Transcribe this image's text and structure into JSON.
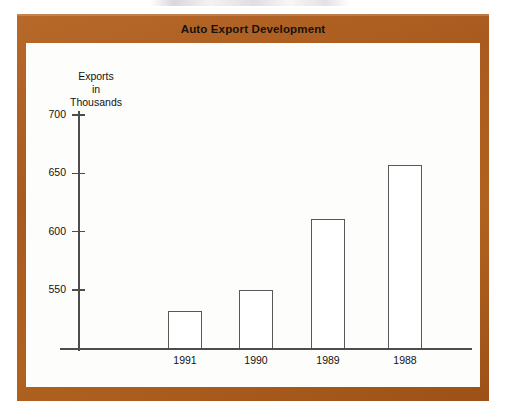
{
  "figure": {
    "title": "Auto Export Development",
    "frame_color": "#a9591d",
    "panel_color": "#fdfdfb",
    "axis_color": "#4d4d4d",
    "bar_outline_color": "#585858",
    "bar_fill_color": "#ffffff"
  },
  "chart_data": {
    "type": "bar",
    "title": "Auto Export Development",
    "xlabel": "",
    "ylabel": "Exports in Thousands",
    "ylabel_lines": [
      "Exports",
      "in",
      "Thousands"
    ],
    "categories": [
      "1991",
      "1990",
      "1989",
      "1988"
    ],
    "values": [
      532,
      550,
      611,
      657
    ],
    "ylim": [
      500,
      700
    ],
    "yticks": [
      550,
      600,
      650,
      700
    ],
    "ytick_labels": [
      "550",
      "600",
      "650",
      "700"
    ],
    "grid": false,
    "legend": null,
    "axis_origin_value": 500
  }
}
